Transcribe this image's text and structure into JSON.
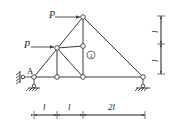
{
  "diagram": {
    "type": "truss",
    "colors": {
      "line": "#3a3a3a",
      "node_fill": "#ffffff",
      "background": "#ffffff"
    },
    "nodes": [
      {
        "id": "A",
        "x": 34,
        "y": 77
      },
      {
        "id": "B",
        "x": 57,
        "y": 77
      },
      {
        "id": "C",
        "x": 83,
        "y": 77
      },
      {
        "id": "D",
        "x": 143,
        "y": 77
      },
      {
        "id": "E",
        "x": 57,
        "y": 48
      },
      {
        "id": "F",
        "x": 83,
        "y": 46
      },
      {
        "id": "G",
        "x": 83,
        "y": 17
      }
    ],
    "labels": {
      "node_A": "A",
      "force_top": "P",
      "force_mid": "P",
      "member_marker": "1",
      "dim_h1": "l",
      "dim_h2": "l",
      "dim_h3": "2l",
      "dim_v1": "l",
      "dim_v2": "l"
    },
    "forces": [
      {
        "label": "P",
        "at": "G",
        "direction": "right"
      },
      {
        "label": "P",
        "at": "E",
        "direction": "right"
      }
    ],
    "supports": [
      {
        "at": "A",
        "type": "pin-wall-and-ground"
      },
      {
        "at": "D",
        "type": "pin-ground"
      }
    ],
    "dimensions": {
      "horizontal": [
        "l",
        "l",
        "2l"
      ],
      "vertical": [
        "l",
        "l"
      ]
    }
  }
}
